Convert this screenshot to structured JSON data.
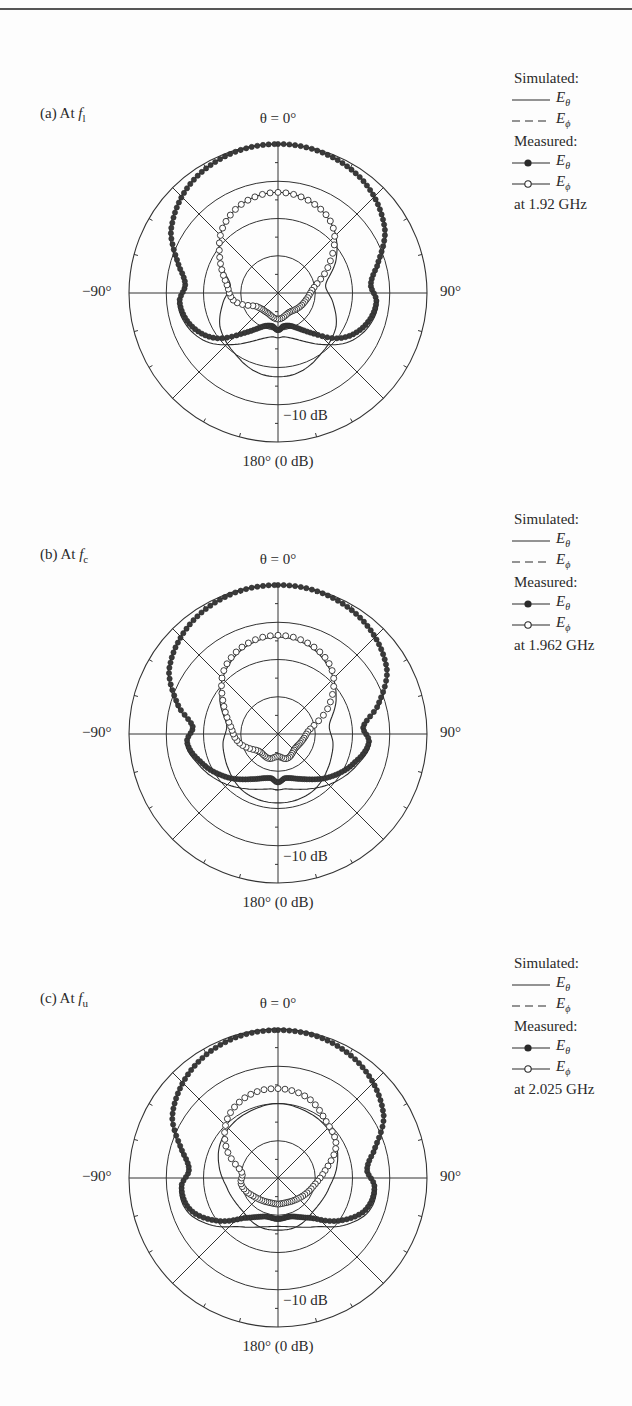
{
  "figure": {
    "colors": {
      "ink": "#2a2a2a",
      "grid": "#333333",
      "filled_marker": "#3a3a3a",
      "open_marker": "#ffffff"
    }
  },
  "legend": {
    "simulated_heading": "Simulated:",
    "measured_heading": "Measured:",
    "e_theta_symbol": "E",
    "e_theta_sub": "θ",
    "e_phi_symbol": "E",
    "e_phi_sub": "ϕ"
  },
  "axes": {
    "theta_zero": "θ = 0°",
    "left": "−90°",
    "right": "90°",
    "bottom": "180° (0 dB)",
    "db_ring": "−10 dB"
  },
  "panels": [
    {
      "label_prefix": "(a) At ",
      "label_f": "f",
      "label_sub": "l",
      "frequency": "at 1.92 GHz"
    },
    {
      "label_prefix": "(b) At ",
      "label_f": "f",
      "label_sub": "c",
      "frequency": "at 1.962 GHz"
    },
    {
      "label_prefix": "(c) At ",
      "label_f": "f",
      "label_sub": "u",
      "frequency": "at 2.025 GHz"
    }
  ],
  "chart_data": [
    {
      "type": "polar",
      "title": "(a) At f_l — at 1.92 GHz",
      "radial_unit": "dB",
      "radial_range": [
        -40,
        0
      ],
      "radial_rings_db": [
        -10,
        -20,
        -30
      ],
      "angular_ticks_deg": [
        0,
        45,
        90,
        135,
        180,
        -135,
        -90,
        -45
      ],
      "angular_labels": [
        "θ = 0°",
        "90°",
        "180° (0 dB)",
        "−90°"
      ],
      "series": [
        {
          "name": "Simulated E_θ",
          "style": "solid",
          "points": [
            [
              0,
              0
            ],
            [
              20,
              -0.6
            ],
            [
              40,
              -2.5
            ],
            [
              60,
              -6.5
            ],
            [
              75,
              -12
            ],
            [
              85,
              -15
            ],
            [
              95,
              -13
            ],
            [
              110,
              -14
            ],
            [
              125,
              -17
            ],
            [
              140,
              -22
            ],
            [
              155,
              -26
            ],
            [
              170,
              -28
            ],
            [
              180,
              -28
            ],
            [
              -170,
              -28
            ],
            [
              -155,
              -26
            ],
            [
              -140,
              -22
            ],
            [
              -125,
              -17
            ],
            [
              -110,
              -14
            ],
            [
              -95,
              -13
            ],
            [
              -85,
              -15
            ],
            [
              -75,
              -12
            ],
            [
              -60,
              -6.5
            ],
            [
              -40,
              -2.5
            ],
            [
              -20,
              -0.6
            ]
          ]
        },
        {
          "name": "Simulated E_ϕ",
          "style": "dashed",
          "points": [
            [
              0,
              -13
            ],
            [
              20,
              -14
            ],
            [
              40,
              -17
            ],
            [
              60,
              -22
            ],
            [
              80,
              -27
            ],
            [
              100,
              -25
            ],
            [
              120,
              -22
            ],
            [
              145,
              -20
            ],
            [
              165,
              -18
            ],
            [
              180,
              -17.5
            ],
            [
              -165,
              -18
            ],
            [
              -145,
              -20
            ],
            [
              -120,
              -22
            ],
            [
              -100,
              -25
            ],
            [
              -80,
              -27
            ],
            [
              -60,
              -22
            ],
            [
              -40,
              -17
            ],
            [
              -20,
              -14
            ]
          ]
        },
        {
          "name": "Measured E_θ",
          "marker": "filled",
          "points": [
            [
              0,
              0
            ],
            [
              20,
              -0.6
            ],
            [
              40,
              -2.6
            ],
            [
              60,
              -6.8
            ],
            [
              75,
              -12.5
            ],
            [
              85,
              -15
            ],
            [
              95,
              -13.5
            ],
            [
              110,
              -15
            ],
            [
              125,
              -19
            ],
            [
              140,
              -26
            ],
            [
              155,
              -30
            ],
            [
              170,
              -31
            ],
            [
              180,
              -30
            ],
            [
              -170,
              -31
            ],
            [
              -155,
              -30
            ],
            [
              -140,
              -26
            ],
            [
              -125,
              -19
            ],
            [
              -110,
              -15
            ],
            [
              -95,
              -13.5
            ],
            [
              -85,
              -15
            ],
            [
              -75,
              -12.5
            ],
            [
              -60,
              -6.8
            ],
            [
              -40,
              -2.6
            ],
            [
              -20,
              -0.6
            ]
          ]
        },
        {
          "name": "Measured E_ϕ",
          "marker": "open",
          "points": [
            [
              0,
              -13
            ],
            [
              20,
              -14
            ],
            [
              40,
              -17
            ],
            [
              60,
              -24
            ],
            [
              80,
              -30
            ],
            [
              100,
              -32
            ],
            [
              120,
              -33
            ],
            [
              150,
              -34
            ],
            [
              180,
              -33
            ],
            [
              -150,
              -34
            ],
            [
              -120,
              -33
            ],
            [
              -100,
              -28
            ],
            [
              -80,
              -26
            ],
            [
              -60,
              -22
            ],
            [
              -40,
              -17
            ],
            [
              -20,
              -14
            ]
          ]
        }
      ]
    },
    {
      "type": "polar",
      "title": "(b) At f_c — at 1.962 GHz",
      "radial_unit": "dB",
      "radial_range": [
        -40,
        0
      ],
      "radial_rings_db": [
        -10,
        -20,
        -30
      ],
      "angular_ticks_deg": [
        0,
        45,
        90,
        135,
        180,
        -135,
        -90,
        -45
      ],
      "angular_labels": [
        "θ = 0°",
        "90°",
        "180° (0 dB)",
        "−90°"
      ],
      "series": [
        {
          "name": "Simulated E_θ",
          "style": "solid",
          "points": [
            [
              0,
              0
            ],
            [
              20,
              -0.5
            ],
            [
              40,
              -2.3
            ],
            [
              60,
              -6
            ],
            [
              75,
              -12
            ],
            [
              85,
              -17
            ],
            [
              95,
              -15
            ],
            [
              110,
              -17
            ],
            [
              130,
              -20
            ],
            [
              150,
              -23
            ],
            [
              170,
              -25
            ],
            [
              180,
              -25
            ],
            [
              -170,
              -25
            ],
            [
              -150,
              -23
            ],
            [
              -130,
              -20
            ],
            [
              -110,
              -17
            ],
            [
              -95,
              -15
            ],
            [
              -85,
              -17
            ],
            [
              -75,
              -12
            ],
            [
              -60,
              -6
            ],
            [
              -40,
              -2.3
            ],
            [
              -20,
              -0.5
            ]
          ]
        },
        {
          "name": "Simulated E_ϕ",
          "style": "dashed",
          "points": [
            [
              0,
              -14
            ],
            [
              20,
              -15
            ],
            [
              40,
              -18
            ],
            [
              60,
              -22
            ],
            [
              80,
              -26
            ],
            [
              100,
              -25
            ],
            [
              120,
              -24
            ],
            [
              150,
              -22
            ],
            [
              180,
              -21.5
            ],
            [
              -150,
              -22
            ],
            [
              -120,
              -24
            ],
            [
              -100,
              -25
            ],
            [
              -80,
              -26
            ],
            [
              -60,
              -22
            ],
            [
              -40,
              -18
            ],
            [
              -20,
              -15
            ]
          ]
        },
        {
          "name": "Measured E_θ",
          "marker": "filled",
          "points": [
            [
              0,
              0
            ],
            [
              20,
              -0.5
            ],
            [
              40,
              -2.4
            ],
            [
              60,
              -6.2
            ],
            [
              75,
              -12.5
            ],
            [
              85,
              -17
            ],
            [
              95,
              -15.5
            ],
            [
              110,
              -18
            ],
            [
              130,
              -22
            ],
            [
              150,
              -26
            ],
            [
              170,
              -28
            ],
            [
              180,
              -27
            ],
            [
              -170,
              -28
            ],
            [
              -150,
              -26
            ],
            [
              -130,
              -22
            ],
            [
              -110,
              -18
            ],
            [
              -95,
              -15.5
            ],
            [
              -85,
              -17
            ],
            [
              -75,
              -12.5
            ],
            [
              -60,
              -6.2
            ],
            [
              -40,
              -2.4
            ],
            [
              -20,
              -0.5
            ]
          ]
        },
        {
          "name": "Measured E_ϕ",
          "marker": "open",
          "points": [
            [
              0,
              -13.5
            ],
            [
              20,
              -14.5
            ],
            [
              40,
              -17.5
            ],
            [
              60,
              -24
            ],
            [
              80,
              -31
            ],
            [
              100,
              -33
            ],
            [
              130,
              -34
            ],
            [
              160,
              -33
            ],
            [
              180,
              -34
            ],
            [
              -160,
              -33
            ],
            [
              -130,
              -33
            ],
            [
              -100,
              -29
            ],
            [
              -80,
              -27
            ],
            [
              -60,
              -23
            ],
            [
              -40,
              -17.5
            ],
            [
              -20,
              -14.5
            ]
          ]
        }
      ]
    },
    {
      "type": "polar",
      "title": "(c) At f_u — at 2.025 GHz",
      "radial_unit": "dB",
      "radial_range": [
        -40,
        0
      ],
      "radial_rings_db": [
        -10,
        -20,
        -30
      ],
      "angular_ticks_deg": [
        0,
        45,
        90,
        135,
        180,
        -135,
        -90,
        -45
      ],
      "angular_labels": [
        "θ = 0°",
        "90°",
        "180° (0 dB)",
        "−90°"
      ],
      "series": [
        {
          "name": "Simulated E_θ",
          "style": "solid",
          "points": [
            [
              0,
              0
            ],
            [
              20,
              -0.7
            ],
            [
              40,
              -2.8
            ],
            [
              60,
              -7
            ],
            [
              75,
              -13
            ],
            [
              85,
              -16
            ],
            [
              95,
              -13.5
            ],
            [
              110,
              -14
            ],
            [
              125,
              -18
            ],
            [
              140,
              -23
            ],
            [
              160,
              -26
            ],
            [
              180,
              -27
            ],
            [
              -160,
              -26
            ],
            [
              -140,
              -23
            ],
            [
              -125,
              -18
            ],
            [
              -110,
              -14
            ],
            [
              -95,
              -13.5
            ],
            [
              -85,
              -16
            ],
            [
              -75,
              -13
            ],
            [
              -60,
              -7
            ],
            [
              -40,
              -2.8
            ],
            [
              -20,
              -0.7
            ]
          ]
        },
        {
          "name": "Simulated E_ϕ",
          "style": "dashed",
          "points": [
            [
              0,
              -20
            ],
            [
              20,
              -20.5
            ],
            [
              40,
              -21
            ],
            [
              60,
              -22
            ],
            [
              80,
              -24
            ],
            [
              100,
              -26
            ],
            [
              130,
              -27
            ],
            [
              160,
              -26
            ],
            [
              180,
              -26
            ],
            [
              -160,
              -26
            ],
            [
              -130,
              -27
            ],
            [
              -100,
              -26
            ],
            [
              -80,
              -24
            ],
            [
              -60,
              -22
            ],
            [
              -40,
              -21
            ],
            [
              -20,
              -20.5
            ]
          ]
        },
        {
          "name": "Measured E_ϕ",
          "marker": "open",
          "points": [
            [
              0,
              -16
            ],
            [
              20,
              -17
            ],
            [
              40,
              -20
            ],
            [
              60,
              -22
            ],
            [
              80,
              -27
            ],
            [
              100,
              -30
            ],
            [
              130,
              -32
            ],
            [
              160,
              -33
            ],
            [
              180,
              -33
            ],
            [
              -160,
              -33
            ],
            [
              -130,
              -32
            ],
            [
              -100,
              -30
            ],
            [
              -80,
              -30
            ],
            [
              -60,
              -24
            ],
            [
              -40,
              -19
            ],
            [
              -20,
              -16.5
            ]
          ]
        },
        {
          "name": "Measured E_θ",
          "marker": "filled",
          "points": [
            [
              0,
              -0.3
            ],
            [
              20,
              -0.8
            ],
            [
              40,
              -3
            ],
            [
              60,
              -7.2
            ],
            [
              75,
              -13.5
            ],
            [
              85,
              -16
            ],
            [
              95,
              -14
            ],
            [
              110,
              -15
            ],
            [
              125,
              -20
            ],
            [
              140,
              -26
            ],
            [
              160,
              -29
            ],
            [
              180,
              -29
            ],
            [
              -160,
              -29
            ],
            [
              -140,
              -26
            ],
            [
              -125,
              -20
            ],
            [
              -110,
              -15
            ],
            [
              -95,
              -14
            ],
            [
              -85,
              -16
            ],
            [
              -75,
              -13.5
            ],
            [
              -60,
              -7.2
            ],
            [
              -40,
              -3
            ],
            [
              -20,
              -0.8
            ]
          ]
        }
      ]
    }
  ]
}
